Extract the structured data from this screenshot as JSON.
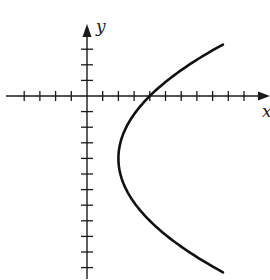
{
  "chart_data": {
    "type": "line",
    "title": "",
    "xlabel": "x",
    "ylabel": "y",
    "grid": false,
    "legend": null,
    "axis_ticks": {
      "x_ticks_unlabeled": [
        -4,
        -3,
        -2,
        -1,
        1,
        2,
        3,
        4,
        5,
        6,
        7,
        8,
        9,
        10
      ],
      "y_ticks_unlabeled": [
        -11,
        -10,
        -9,
        -8,
        -7,
        -6,
        -5,
        -4,
        -3,
        -2,
        -1,
        1,
        2,
        3
      ]
    },
    "xlim": [
      -5.3,
      11.7
    ],
    "ylim": [
      -11.8,
      4.5
    ],
    "series": [
      {
        "name": "parabola opening right",
        "equation": "x = (y + 4)^2 / 8 + 2",
        "vertex": [
          2,
          -4
        ],
        "x_intercept": [
          4,
          0
        ],
        "y_range": [
          -11.3,
          3.3
        ],
        "points": [
          [
            8.66,
            3.3
          ],
          [
            6.5,
            2
          ],
          [
            5.13,
            1
          ],
          [
            4,
            0
          ],
          [
            3.13,
            -1
          ],
          [
            2.5,
            -2
          ],
          [
            2.13,
            -3
          ],
          [
            2,
            -4
          ],
          [
            2.13,
            -5
          ],
          [
            2.5,
            -6
          ],
          [
            3.13,
            -7
          ],
          [
            4,
            -8
          ],
          [
            5.13,
            -9
          ],
          [
            6.5,
            -10
          ],
          [
            8.66,
            -11.3
          ]
        ]
      }
    ]
  },
  "labels": {
    "x_axis": "x",
    "y_axis": "y"
  },
  "geometry": {
    "origin_px": [
      87,
      96
    ],
    "unit_px_x": 15.7,
    "unit_px_y": 15.6
  }
}
